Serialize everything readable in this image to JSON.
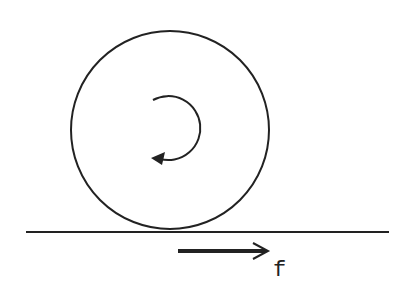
{
  "diagram": {
    "colors": {
      "stroke": "#222222",
      "background": "#ffffff"
    },
    "wheel": {
      "cx": 170,
      "cy": 130,
      "r": 99
    },
    "rotation_arrow": {
      "direction": "clockwise",
      "cx": 170,
      "cy": 130,
      "r": 33
    },
    "ground": {
      "y": 231,
      "x1": 26,
      "x2": 389
    },
    "force_arrow": {
      "x1": 178,
      "x2": 268,
      "y": 251,
      "label": "f"
    }
  }
}
